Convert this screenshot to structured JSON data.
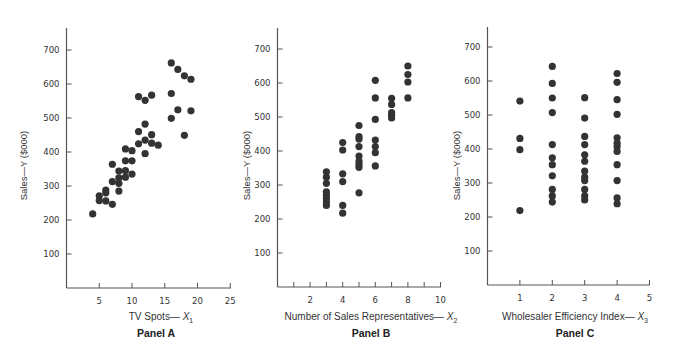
{
  "figure": {
    "y_tick_labels": [
      "100",
      "200",
      "300",
      "400",
      "500",
      "600",
      "700"
    ]
  },
  "panels": [
    {
      "title": "Panel A",
      "ylabel": "Sales—Y ($000)",
      "xlabel_text": "TV Spots— ",
      "xlabel_var": "X",
      "xlabel_sub": "1",
      "x_tick_labels": [
        "5",
        "10",
        "15",
        "20",
        "25"
      ]
    },
    {
      "title": "Panel B",
      "ylabel": "Sales—Y ($000)",
      "xlabel_text": "Number of Sales Representatives— ",
      "xlabel_var": "X",
      "xlabel_sub": "2",
      "x_tick_labels": [
        "2",
        "4",
        "6",
        "8",
        "10"
      ]
    },
    {
      "title": "Panel C",
      "ylabel": "Sales—Y ($000)",
      "xlabel_text": "Wholesaler Efficiency Index— ",
      "xlabel_var": "X",
      "xlabel_sub": "3",
      "x_tick_labels": [
        "1",
        "2",
        "3",
        "4",
        "5"
      ]
    }
  ],
  "chart_data": [
    {
      "type": "scatter",
      "title": "Panel A",
      "xlabel": "TV Spots—X1",
      "ylabel": "Sales—Y ($000)",
      "xlim": [
        0,
        25
      ],
      "ylim": [
        0,
        750
      ],
      "x_ticks": [
        5,
        10,
        15,
        20,
        25
      ],
      "y_ticks": [
        100,
        200,
        300,
        400,
        500,
        600,
        700
      ],
      "grid": false,
      "marker_color": "#333333",
      "x": [
        4,
        5,
        5,
        6,
        6,
        6,
        7,
        7,
        7,
        8,
        8,
        8,
        8,
        9,
        9,
        9,
        9,
        10,
        10,
        10,
        11,
        11,
        11,
        12,
        12,
        12,
        12,
        13,
        13,
        14,
        13,
        16,
        17,
        18,
        19,
        16,
        17,
        19,
        16,
        18
      ],
      "y": [
        218,
        271,
        257,
        280,
        288,
        256,
        246,
        364,
        313,
        324,
        308,
        285,
        344,
        409,
        374,
        345,
        326,
        404,
        374,
        335,
        563,
        460,
        424,
        552,
        482,
        435,
        395,
        451,
        426,
        420,
        567,
        662,
        643,
        624,
        614,
        572,
        524,
        521,
        499,
        449
      ]
    },
    {
      "type": "scatter",
      "title": "Panel B",
      "xlabel": "Number of Sales Representatives—X2",
      "ylabel": "Sales—Y ($000)",
      "xlim": [
        0,
        10
      ],
      "ylim": [
        0,
        750
      ],
      "x_ticks": [
        1,
        2,
        3,
        4,
        5,
        6,
        7,
        8,
        9,
        10
      ],
      "x_tick_labels": [
        2,
        4,
        6,
        8,
        10
      ],
      "y_ticks": [
        100,
        200,
        300,
        400,
        500,
        600,
        700
      ],
      "grid": false,
      "marker_color": "#333333",
      "x": [
        3,
        3,
        3,
        3,
        3,
        3,
        3,
        3,
        4,
        4,
        4,
        4,
        4,
        4,
        5,
        5,
        5,
        5,
        5,
        5,
        5,
        5,
        5,
        6,
        6,
        6,
        6,
        6,
        6,
        6,
        7,
        7,
        7,
        7,
        7,
        8,
        8,
        8,
        8
      ],
      "y": [
        339,
        323,
        305,
        280,
        270,
        260,
        250,
        240,
        425,
        403,
        333,
        310,
        240,
        217,
        475,
        442,
        435,
        413,
        385,
        370,
        360,
        352,
        277,
        608,
        556,
        493,
        432,
        413,
        395,
        356,
        555,
        537,
        513,
        505,
        497,
        650,
        625,
        603,
        556
      ]
    },
    {
      "type": "scatter",
      "title": "Panel C",
      "xlabel": "Wholesaler Efficiency Index—X3",
      "ylabel": "Sales—Y ($000)",
      "xlim": [
        0,
        5
      ],
      "ylim": [
        0,
        750
      ],
      "x_ticks": [
        1,
        2,
        3,
        4,
        5
      ],
      "y_ticks": [
        100,
        200,
        300,
        400,
        500,
        600,
        700
      ],
      "grid": false,
      "marker_color": "#333333",
      "x": [
        1,
        1,
        1,
        1,
        2,
        2,
        2,
        2,
        2,
        2,
        2,
        2,
        2,
        2,
        2,
        3,
        3,
        3,
        3,
        3,
        3,
        3,
        3,
        3,
        3,
        3,
        3,
        4,
        4,
        4,
        4,
        4,
        4,
        4,
        4,
        4,
        4,
        4,
        4
      ],
      "y": [
        541,
        431,
        398,
        219,
        643,
        593,
        550,
        507,
        413,
        374,
        354,
        321,
        281,
        262,
        244,
        551,
        491,
        437,
        413,
        383,
        364,
        335,
        317,
        307,
        281,
        262,
        250,
        622,
        596,
        545,
        502,
        433,
        417,
        407,
        393,
        354,
        307,
        256,
        239
      ]
    }
  ]
}
